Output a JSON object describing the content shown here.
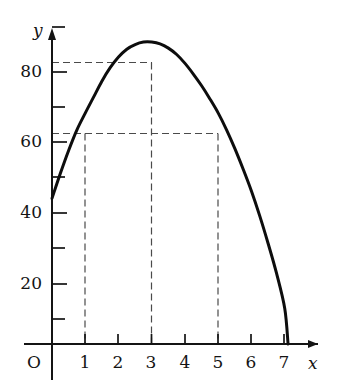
{
  "figure": {
    "background_color": "#ffffff",
    "ink_color": "#141414",
    "curve_color": "#0d0d0d",
    "guide_color": "#4a4a4a",
    "origin_label": "O",
    "x_axis_name": "x",
    "y_axis_name": "y"
  },
  "chart_data": {
    "type": "line",
    "title": "",
    "subtitle": "",
    "xlabel": "x",
    "ylabel": "y",
    "xlim": [
      0,
      7.6
    ],
    "ylim": [
      0,
      95
    ],
    "grid": false,
    "legend": "none",
    "x_ticks": [
      1,
      2,
      3,
      4,
      5,
      6,
      7
    ],
    "x_tick_labels": [
      "1",
      "2",
      "3",
      "4",
      "5",
      "6",
      "7"
    ],
    "y_ticks": [
      10,
      20,
      30,
      40,
      50,
      60,
      70,
      80,
      90
    ],
    "y_tick_labels": [
      "",
      "20",
      "",
      "40",
      "",
      "60",
      "",
      "80",
      ""
    ],
    "y_labeled_ticks": [
      20,
      40,
      60,
      80
    ],
    "y_minor_ticks": [
      10,
      30,
      50,
      70,
      90
    ],
    "series": [
      {
        "name": "curve",
        "x": [
          0,
          0.25,
          0.5,
          0.75,
          1,
          1.25,
          1.5,
          1.75,
          2,
          2.25,
          2.5,
          2.75,
          3,
          3.25,
          3.5,
          3.75,
          4,
          4.25,
          4.5,
          4.75,
          5,
          5.25,
          5.5,
          5.75,
          6,
          6.25,
          6.5,
          6.75,
          7,
          7.1
        ],
        "y": [
          41,
          48,
          54.5,
          60.3,
          65,
          69.5,
          74,
          77.8,
          80.8,
          83,
          84.3,
          85,
          85,
          84.5,
          83.3,
          81.5,
          79,
          76,
          72.7,
          69,
          65,
          60.3,
          55,
          49.2,
          43,
          36,
          28.3,
          20,
          10,
          0
        ]
      }
    ],
    "annotations": [
      {
        "type": "horizontal-guide",
        "y": 85,
        "x_from": 0,
        "x_to": 3,
        "style": "dashed",
        "description": "maximum value guide line"
      },
      {
        "type": "horizontal-guide",
        "y": 65,
        "x_from": 0,
        "x_to": 5,
        "style": "dashed",
        "description": "y = 65 level guide line"
      },
      {
        "type": "vertical-guide",
        "x": 1,
        "y_from": 0,
        "y_to": 65,
        "style": "dashed"
      },
      {
        "type": "vertical-guide",
        "x": 3,
        "y_from": 0,
        "y_to": 85,
        "style": "dashed"
      },
      {
        "type": "vertical-guide",
        "x": 5,
        "y_from": 0,
        "y_to": 65,
        "style": "dashed"
      }
    ],
    "key_points": [
      {
        "label": "y-intercept",
        "x": 0,
        "y": 41
      },
      {
        "label": "maximum",
        "x": 3,
        "y": 85
      },
      {
        "label": "level-left",
        "x": 1,
        "y": 65
      },
      {
        "label": "level-right",
        "x": 5,
        "y": 65
      },
      {
        "label": "x-intercept",
        "x": 7.1,
        "y": 0
      }
    ]
  },
  "labels": {
    "y_axis": [
      {
        "text": "80",
        "value": 80
      },
      {
        "text": "60",
        "value": 60
      },
      {
        "text": "40",
        "value": 40
      },
      {
        "text": "20",
        "value": 20
      }
    ],
    "x_axis": [
      {
        "text": "1",
        "value": 1
      },
      {
        "text": "2",
        "value": 2
      },
      {
        "text": "3",
        "value": 3
      },
      {
        "text": "4",
        "value": 4
      },
      {
        "text": "5",
        "value": 5
      },
      {
        "text": "6",
        "value": 6
      },
      {
        "text": "7",
        "value": 7
      }
    ],
    "origin": "O",
    "x_name": "x",
    "y_name": "y"
  }
}
